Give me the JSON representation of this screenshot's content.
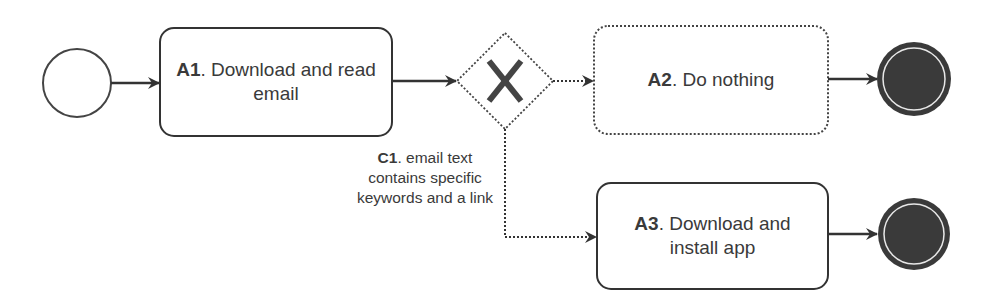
{
  "diagram": {
    "type": "bpmn-process",
    "start_event": {
      "shape": "circle"
    },
    "tasks": [
      {
        "id": "A1",
        "code": "A1",
        "text": ". Download and read",
        "text2": "email",
        "border": "solid"
      },
      {
        "id": "A2",
        "code": "A2",
        "text": ". Do nothing",
        "border": "dotted"
      },
      {
        "id": "A3",
        "code": "A3",
        "text": ". Download and",
        "text2": "install app",
        "border": "solid"
      }
    ],
    "gateway": {
      "type": "exclusive",
      "icon": "x-icon",
      "border": "dotted"
    },
    "condition": {
      "code": "C1",
      "line1": ". email text",
      "line2": "contains specific",
      "line3": "keywords and a link"
    },
    "end_events": [
      {
        "after": "A2"
      },
      {
        "after": "A3"
      }
    ],
    "colors": {
      "stroke": "#333333",
      "end_fill": "#3a3a3a",
      "text": "#3a3a3a"
    }
  }
}
